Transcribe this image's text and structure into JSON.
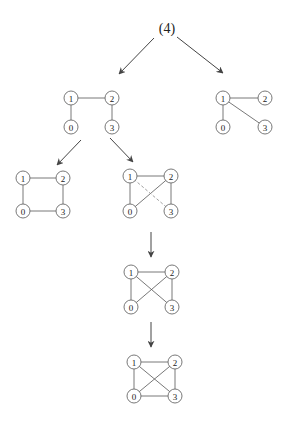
{
  "root": {
    "label": "(4)",
    "x": 167,
    "y": 28
  },
  "node_radius": 7,
  "graphs": [
    {
      "id": "level1-left",
      "nodes": [
        {
          "id": "1",
          "x": 71,
          "y": 98
        },
        {
          "id": "2",
          "x": 112,
          "y": 98
        },
        {
          "id": "0",
          "x": 71,
          "y": 127
        },
        {
          "id": "3",
          "x": 112,
          "y": 127
        }
      ],
      "edges": [
        [
          "1",
          "2"
        ],
        [
          "1",
          "0"
        ],
        [
          "2",
          "3"
        ]
      ],
      "dashed_edges": []
    },
    {
      "id": "level1-right",
      "nodes": [
        {
          "id": "1",
          "x": 223,
          "y": 98
        },
        {
          "id": "2",
          "x": 265,
          "y": 98
        },
        {
          "id": "0",
          "x": 223,
          "y": 127
        },
        {
          "id": "3",
          "x": 265,
          "y": 127
        }
      ],
      "edges": [
        [
          "1",
          "2"
        ],
        [
          "1",
          "0"
        ],
        [
          "1",
          "3"
        ]
      ],
      "dashed_edges": []
    },
    {
      "id": "level2-left",
      "nodes": [
        {
          "id": "1",
          "x": 23,
          "y": 178
        },
        {
          "id": "2",
          "x": 63,
          "y": 178
        },
        {
          "id": "0",
          "x": 23,
          "y": 211
        },
        {
          "id": "3",
          "x": 63,
          "y": 211
        }
      ],
      "edges": [
        [
          "1",
          "2"
        ],
        [
          "1",
          "0"
        ],
        [
          "2",
          "3"
        ],
        [
          "0",
          "3"
        ]
      ],
      "dashed_edges": []
    },
    {
      "id": "level2-right",
      "nodes": [
        {
          "id": "1",
          "x": 130,
          "y": 176
        },
        {
          "id": "2",
          "x": 171,
          "y": 176
        },
        {
          "id": "0",
          "x": 130,
          "y": 211
        },
        {
          "id": "3",
          "x": 171,
          "y": 211
        }
      ],
      "edges": [
        [
          "1",
          "2"
        ],
        [
          "1",
          "0"
        ],
        [
          "0",
          "2"
        ],
        [
          "2",
          "3"
        ]
      ],
      "dashed_edges": [
        [
          "1",
          "3"
        ]
      ]
    },
    {
      "id": "level3",
      "nodes": [
        {
          "id": "1",
          "x": 131,
          "y": 272
        },
        {
          "id": "2",
          "x": 172,
          "y": 272
        },
        {
          "id": "0",
          "x": 131,
          "y": 307
        },
        {
          "id": "3",
          "x": 172,
          "y": 307
        }
      ],
      "edges": [
        [
          "1",
          "2"
        ],
        [
          "1",
          "0"
        ],
        [
          "1",
          "3"
        ],
        [
          "0",
          "2"
        ],
        [
          "2",
          "3"
        ]
      ],
      "dashed_edges": []
    },
    {
      "id": "level4",
      "nodes": [
        {
          "id": "1",
          "x": 134,
          "y": 362
        },
        {
          "id": "2",
          "x": 175,
          "y": 362
        },
        {
          "id": "0",
          "x": 134,
          "y": 396
        },
        {
          "id": "3",
          "x": 175,
          "y": 396
        }
      ],
      "edges": [
        [
          "1",
          "2"
        ],
        [
          "1",
          "0"
        ],
        [
          "1",
          "3"
        ],
        [
          "0",
          "2"
        ],
        [
          "2",
          "3"
        ],
        [
          "0",
          "3"
        ]
      ],
      "dashed_edges": []
    }
  ],
  "arrows": [
    {
      "id": "root-to-left",
      "x1": 154,
      "y1": 38,
      "x2": 119,
      "y2": 74
    },
    {
      "id": "root-to-right",
      "x1": 177,
      "y1": 37,
      "x2": 223,
      "y2": 73
    },
    {
      "id": "left-to-square",
      "x1": 81,
      "y1": 140,
      "x2": 57,
      "y2": 165
    },
    {
      "id": "left-to-dashed",
      "x1": 110,
      "y1": 138,
      "x2": 133,
      "y2": 162
    },
    {
      "id": "dashed-to-level3",
      "x1": 151,
      "y1": 232,
      "x2": 151,
      "y2": 257
    },
    {
      "id": "level3-to-complete",
      "x1": 151,
      "y1": 322,
      "x2": 151,
      "y2": 347
    }
  ]
}
